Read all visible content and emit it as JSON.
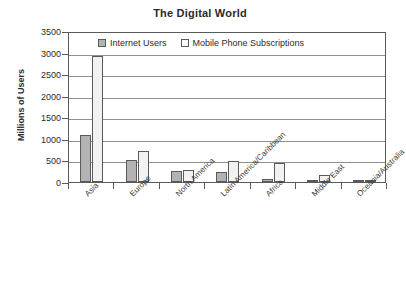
{
  "chart_data": {
    "type": "bar",
    "title": "The Digital World",
    "xlabel": "",
    "ylabel": "Millions of Users",
    "ylim": [
      0,
      3500
    ],
    "ytick_values": [
      0,
      500,
      1000,
      1500,
      2000,
      2500,
      3000,
      3500
    ],
    "ytick_labels": [
      "0",
      "500",
      "1000",
      "1500",
      "2000",
      "2500",
      "3000",
      "3500"
    ],
    "grid": true,
    "legend_position": "upper-center-inside",
    "categories": [
      "Asia",
      "Europe",
      "North America",
      "Latin America/Caribbean",
      "Africa",
      "Middle East",
      "Oceania/Australia"
    ],
    "series": [
      {
        "name": "Internet Users",
        "color": "#b3b3b3",
        "values": [
          1090,
          500,
          245,
          235,
          70,
          20,
          25
        ]
      },
      {
        "name": "Mobile Phone Subscriptions",
        "color": "#f2f2f2",
        "values": [
          2910,
          720,
          285,
          490,
          430,
          170,
          10
        ]
      }
    ]
  },
  "colors": {
    "series_internet": "#b3b3b3",
    "series_mobile": "#f2f2f2",
    "axis": "#5a5a5a",
    "grid": "#8e8e8e",
    "text": "#2b2b2b",
    "background": "#ffffff"
  }
}
